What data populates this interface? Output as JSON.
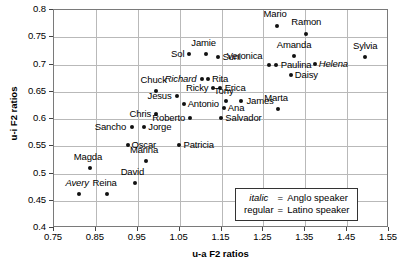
{
  "chart_data": {
    "type": "scatter",
    "title": "",
    "xlabel": "u-a F2 ratios",
    "ylabel": "u-i F2 ratios",
    "xlim": [
      0.75,
      1.55
    ],
    "ylim": [
      0.4,
      0.8
    ],
    "xticks": [
      "0.75",
      "0.85",
      "0.95",
      "1.05",
      "1.15",
      "1.25",
      "1.35",
      "1.45",
      "1.55"
    ],
    "xtick_values": [
      0.75,
      0.85,
      0.95,
      1.05,
      1.15,
      1.25,
      1.35,
      1.45,
      1.55
    ],
    "yticks": [
      "0.4",
      "0.45",
      "0.5",
      "0.55",
      "0.6",
      "0.65",
      "0.7",
      "0.75",
      "0.8"
    ],
    "ytick_values": [
      0.4,
      0.45,
      0.5,
      0.55,
      0.6,
      0.65,
      0.7,
      0.75,
      0.8
    ],
    "grid": true,
    "legend_position": "bottom-right",
    "points": [
      {
        "name": "Mario",
        "x": 1.285,
        "y": 0.768,
        "style": "regular",
        "label_dx": -2,
        "label_dy": -13,
        "label_anchor": "center"
      },
      {
        "name": "Ramon",
        "x": 1.355,
        "y": 0.755,
        "style": "regular",
        "label_dx": 0,
        "label_dy": -13,
        "label_anchor": "center"
      },
      {
        "name": "Sol",
        "x": 1.075,
        "y": 0.718,
        "style": "regular",
        "label_dx": -5,
        "label_dy": -1,
        "label_anchor": "right"
      },
      {
        "name": "Jamie",
        "x": 1.115,
        "y": 0.718,
        "style": "regular",
        "label_dx": -2,
        "label_dy": -12,
        "label_anchor": "center"
      },
      {
        "name": "Suni",
        "x": 1.145,
        "y": 0.712,
        "style": "regular",
        "label_dx": 4,
        "label_dy": -1,
        "label_anchor": "left"
      },
      {
        "name": "Amanda",
        "x": 1.325,
        "y": 0.713,
        "style": "regular",
        "label_dx": 0,
        "label_dy": -12,
        "label_anchor": "center"
      },
      {
        "name": "Sylvia",
        "x": 1.495,
        "y": 0.712,
        "style": "regular",
        "label_dx": 0,
        "label_dy": -12,
        "label_anchor": "center"
      },
      {
        "name": "Veronica",
        "x": 1.265,
        "y": 0.697,
        "style": "regular",
        "label_dx": -6,
        "label_dy": -10,
        "label_anchor": "right"
      },
      {
        "name": "Paulina",
        "x": 1.282,
        "y": 0.697,
        "style": "regular",
        "label_dx": 5,
        "label_dy": -1,
        "label_anchor": "left"
      },
      {
        "name": "Helena",
        "x": 1.375,
        "y": 0.7,
        "style": "anglo",
        "label_dx": 4,
        "label_dy": -1,
        "label_anchor": "left"
      },
      {
        "name": "Richard",
        "x": 1.105,
        "y": 0.672,
        "style": "anglo",
        "label_dx": -5,
        "label_dy": -1,
        "label_anchor": "right"
      },
      {
        "name": "Rita",
        "x": 1.12,
        "y": 0.672,
        "style": "regular",
        "label_dx": 4,
        "label_dy": -1,
        "label_anchor": "left"
      },
      {
        "name": "Ricky",
        "x": 1.132,
        "y": 0.655,
        "style": "regular",
        "label_dx": -5,
        "label_dy": -1,
        "label_anchor": "right"
      },
      {
        "name": "Erica",
        "x": 1.148,
        "y": 0.655,
        "style": "regular",
        "label_dx": 5,
        "label_dy": -1,
        "label_anchor": "left"
      },
      {
        "name": "Daisy",
        "x": 1.318,
        "y": 0.678,
        "style": "regular",
        "label_dx": 4,
        "label_dy": -1,
        "label_anchor": "left"
      },
      {
        "name": "Chuck",
        "x": 0.995,
        "y": 0.65,
        "style": "regular",
        "label_dx": -2,
        "label_dy": -12,
        "label_anchor": "center"
      },
      {
        "name": "Jesus",
        "x": 1.045,
        "y": 0.64,
        "style": "regular",
        "label_dx": -5,
        "label_dy": -1,
        "label_anchor": "right"
      },
      {
        "name": "Tony",
        "x": 1.162,
        "y": 0.632,
        "style": "regular",
        "label_dx": -2,
        "label_dy": -11,
        "label_anchor": "center"
      },
      {
        "name": "James",
        "x": 1.2,
        "y": 0.632,
        "style": "regular",
        "label_dx": 5,
        "label_dy": -1,
        "label_anchor": "left"
      },
      {
        "name": "Antonio",
        "x": 1.062,
        "y": 0.625,
        "style": "regular",
        "label_dx": 4,
        "label_dy": -1,
        "label_anchor": "left"
      },
      {
        "name": "Ana",
        "x": 1.158,
        "y": 0.618,
        "style": "regular",
        "label_dx": 4,
        "label_dy": -1,
        "label_anchor": "left"
      },
      {
        "name": "Marta",
        "x": 1.288,
        "y": 0.617,
        "style": "regular",
        "label_dx": -2,
        "label_dy": -12,
        "label_anchor": "center"
      },
      {
        "name": "Chris",
        "x": 0.995,
        "y": 0.607,
        "style": "regular",
        "label_dx": -5,
        "label_dy": -1,
        "label_anchor": "right"
      },
      {
        "name": "Roberto",
        "x": 1.078,
        "y": 0.6,
        "style": "regular",
        "label_dx": -5,
        "label_dy": -1,
        "label_anchor": "right"
      },
      {
        "name": "Salvador",
        "x": 1.152,
        "y": 0.6,
        "style": "regular",
        "label_dx": 4,
        "label_dy": -1,
        "label_anchor": "left"
      },
      {
        "name": "Sancho",
        "x": 0.938,
        "y": 0.583,
        "style": "regular",
        "label_dx": -6,
        "label_dy": -1,
        "label_anchor": "right"
      },
      {
        "name": "Jorge",
        "x": 0.968,
        "y": 0.583,
        "style": "regular",
        "label_dx": 4,
        "label_dy": -1,
        "label_anchor": "left"
      },
      {
        "name": "Oscar",
        "x": 0.928,
        "y": 0.551,
        "style": "regular",
        "label_dx": 4,
        "label_dy": -1,
        "label_anchor": "left"
      },
      {
        "name": "Patricia",
        "x": 1.052,
        "y": 0.551,
        "style": "regular",
        "label_dx": 4,
        "label_dy": -1,
        "label_anchor": "left"
      },
      {
        "name": "Marina",
        "x": 0.972,
        "y": 0.521,
        "style": "regular",
        "label_dx": -2,
        "label_dy": -12,
        "label_anchor": "center"
      },
      {
        "name": "Magda",
        "x": 0.838,
        "y": 0.509,
        "style": "regular",
        "label_dx": -2,
        "label_dy": -12,
        "label_anchor": "center"
      },
      {
        "name": "David",
        "x": 0.945,
        "y": 0.481,
        "style": "regular",
        "label_dx": -2,
        "label_dy": -12,
        "label_anchor": "center"
      },
      {
        "name": "Avery",
        "x": 0.812,
        "y": 0.461,
        "style": "anglo",
        "label_dx": -2,
        "label_dy": -12,
        "label_anchor": "center"
      },
      {
        "name": "Reina",
        "x": 0.878,
        "y": 0.461,
        "style": "regular",
        "label_dx": -2,
        "label_dy": -12,
        "label_anchor": "center"
      }
    ],
    "legend": {
      "rows": [
        {
          "key": "italic",
          "eq": "=",
          "value": "Anglo speaker",
          "key_style": "italic"
        },
        {
          "key": "regular",
          "eq": "=",
          "value": "Latino speaker",
          "key_style": "regular"
        }
      ]
    }
  }
}
